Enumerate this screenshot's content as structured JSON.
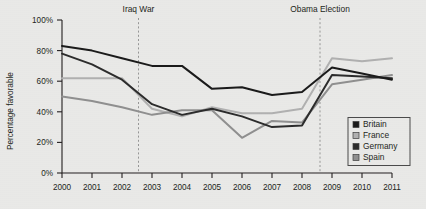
{
  "chart_data": {
    "type": "line",
    "title": "",
    "xlabel": "",
    "ylabel": "Percentage favorable",
    "x": [
      2000,
      2001,
      2002,
      2003,
      2004,
      2005,
      2006,
      2007,
      2008,
      2009,
      2010,
      2011
    ],
    "xtick_labels": [
      "2000",
      "2001",
      "2002",
      "2003",
      "2004",
      "2005",
      "2006",
      "2007",
      "2008",
      "2009",
      "2010",
      "2011"
    ],
    "ytick_labels": [
      "0%",
      "20%",
      "40%",
      "60%",
      "80%",
      "100%"
    ],
    "yticks": [
      0,
      20,
      40,
      60,
      80,
      100
    ],
    "ylim": [
      0,
      100
    ],
    "xlim": [
      2000,
      2011
    ],
    "grid": false,
    "legend_position": "lower-right",
    "series": [
      {
        "name": "Britain",
        "color": "#1a1a1a",
        "values": [
          83,
          80,
          75,
          70,
          70,
          55,
          56,
          51,
          53,
          69,
          65,
          61
        ]
      },
      {
        "name": "France",
        "color": "#b0b0b0",
        "values": [
          62,
          62,
          62,
          42,
          37,
          43,
          39,
          39,
          42,
          75,
          73,
          75
        ]
      },
      {
        "name": "Germany",
        "color": "#2b2b2b",
        "values": [
          78,
          71,
          61,
          45,
          38,
          42,
          37,
          30,
          31,
          64,
          63,
          62
        ]
      },
      {
        "name": "Spain",
        "color": "#8f8f8f",
        "values": [
          50,
          47,
          43,
          38,
          41,
          41,
          23,
          34,
          33,
          58,
          61,
          64
        ]
      }
    ],
    "annotations": [
      {
        "label": "Iraq War",
        "x": 2002.55,
        "line": "dashed"
      },
      {
        "label": "Obama Election",
        "x": 2008.6,
        "line": "dashed"
      }
    ]
  },
  "colors": {
    "background": "#e9e9e7",
    "axis": "#231f20",
    "annotation_line": "#8c8c8c",
    "legend_border": "#4a4a4a"
  }
}
